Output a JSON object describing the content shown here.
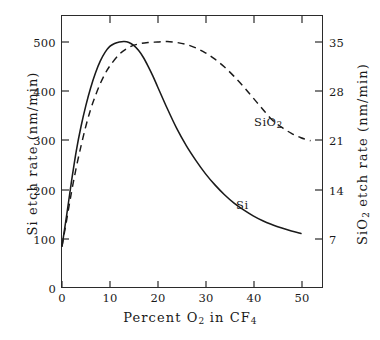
{
  "chart_data": {
    "type": "line",
    "title": "",
    "subtitle": "",
    "xlabel": "Percent O2 in CF4",
    "ylabel": "Si etch rate (nm/min)",
    "ylabel_right": "SiO2 etch rate (nm/min)",
    "xlim": [
      0,
      54.4
    ],
    "ylim": [
      0,
      556
    ],
    "ylim_right": [
      0,
      38.9
    ],
    "grid": false,
    "legend": "inline-annotations",
    "xticks": [
      0,
      10,
      20,
      30,
      40,
      50
    ],
    "xticklabels": [
      "0",
      "10",
      "20",
      "30",
      "40",
      "50"
    ],
    "yticks": [
      0,
      100,
      200,
      300,
      400,
      500
    ],
    "yticklabels": [
      "0",
      "100",
      "200",
      "300",
      "400",
      "500"
    ],
    "yticks_right": [
      7,
      14,
      21,
      28,
      35
    ],
    "yticklabels_right": [
      "7",
      "14",
      "21",
      "28",
      "35"
    ],
    "right_axis_mapping": "7 nm/min (SiO2) aligns with 100 nm/min (Si); scale factor 1/14.286",
    "series": [
      {
        "name": "Si",
        "label": "Si",
        "linestyle": "solid",
        "color": "#1a1a1a",
        "x": [
          0,
          1,
          2,
          3,
          4,
          5,
          6,
          7,
          8,
          9,
          10,
          11,
          12,
          13,
          14,
          15,
          16,
          17,
          18,
          19,
          20,
          22,
          24,
          26,
          28,
          30,
          32,
          34,
          36,
          38,
          40,
          42,
          44,
          46,
          48,
          50
        ],
        "values": [
          85,
          150,
          218,
          280,
          330,
          372,
          408,
          438,
          462,
          480,
          492,
          498,
          501,
          502,
          500,
          494,
          484,
          470,
          452,
          432,
          410,
          366,
          325,
          290,
          260,
          233,
          210,
          190,
          173,
          159,
          147,
          137,
          129,
          122,
          116,
          111
        ]
      },
      {
        "name": "SiO2",
        "label": "SiO2",
        "linestyle": "dashed",
        "color": "#1a1a1a",
        "x": [
          0,
          1,
          2,
          3,
          4,
          5,
          6,
          7,
          8,
          9,
          10,
          12,
          14,
          16,
          18,
          20,
          22,
          24,
          26,
          28,
          30,
          32,
          34,
          36,
          38,
          40,
          42,
          44,
          46,
          48,
          50,
          52
        ],
        "values": [
          85,
          140,
          196,
          246,
          290,
          330,
          364,
          392,
          416,
          436,
          452,
          476,
          490,
          497,
          500,
          501,
          502,
          500,
          496,
          489,
          479,
          466,
          450,
          431,
          410,
          387,
          364,
          342,
          327,
          315,
          306,
          300
        ],
        "values_right_axis": [
          5.95,
          9.8,
          13.7,
          17.2,
          20.3,
          23.1,
          25.5,
          27.4,
          29.1,
          30.5,
          31.6,
          33.3,
          34.3,
          34.8,
          35.0,
          35.1,
          35.1,
          35.0,
          34.7,
          34.2,
          33.5,
          32.6,
          31.5,
          30.2,
          28.7,
          27.1,
          25.5,
          23.9,
          22.9,
          22.1,
          21.4,
          21.0
        ]
      }
    ],
    "annotations": [
      {
        "text": "SiO2",
        "x": 41.5,
        "y": 345
      },
      {
        "text": "Si",
        "x": 37.0,
        "y": 175
      }
    ]
  },
  "axes": {
    "x_tick_labels": [
      "0",
      "10",
      "20",
      "30",
      "40",
      "50"
    ],
    "y_left_tick_labels": [
      "0",
      "100",
      "200",
      "300",
      "400",
      "500"
    ],
    "y_right_tick_labels": [
      "7",
      "14",
      "21",
      "28",
      "35"
    ],
    "x_title_parts": {
      "pre": "Percent O",
      "sub1": "2",
      "mid": " in CF",
      "sub2": "4"
    },
    "y_left_title": "Si etch rate (nm/min)",
    "y_right_title_parts": {
      "pre": "SiO",
      "sub": "2",
      "post": " etch rate (nm/min)"
    }
  },
  "annotations": {
    "sio2_label_parts": {
      "pre": "SiO",
      "sub": "2"
    },
    "si_label": "Si"
  },
  "colors": {
    "line": "#1a1a1a",
    "frame": "#2b2b2b",
    "background": "#ffffff"
  }
}
